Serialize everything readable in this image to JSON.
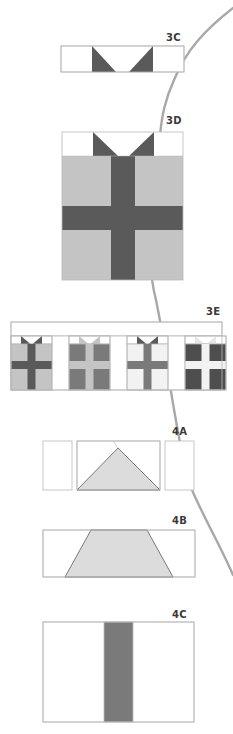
{
  "colors": {
    "outline": "#b8b8b8",
    "dark": "#5a5a5a",
    "medium": "#7a7a7a",
    "light": "#c4c4c4",
    "pale": "#dcdcdc",
    "white": "#ffffff",
    "curve": "#a8a8a8",
    "label": "#3a3a3a"
  },
  "labels": {
    "l3c": "3C",
    "l3d": "3D",
    "l3e": "3E",
    "l4a": "4A",
    "l4b": "4B",
    "l4c": "4C"
  },
  "pieces": [
    {
      "id": "3C",
      "description": "Bow strip: white rectangle with two dark triangles forming a V notch"
    },
    {
      "id": "3D",
      "description": "Single gift block: bow row above light square with dark vertical and horizontal ribbon"
    },
    {
      "id": "3E",
      "description": "Row of four gift blocks with white sashing strip above and between"
    },
    {
      "id": "4A",
      "description": "Three pieces: narrow rectangle, rectangle with pale triangle, narrow rectangle"
    },
    {
      "id": "4B",
      "description": "Rectangle with pale trapezoid"
    },
    {
      "id": "4C",
      "description": "White rectangle with dark vertical center strip"
    }
  ],
  "gifts_3e": [
    {
      "bow": "#5a5a5a",
      "body": "#c4c4c4",
      "ribbon_v": "#5a5a5a",
      "ribbon_h": "#5a5a5a"
    },
    {
      "bow": "#c4c4c4",
      "body": "#7a7a7a",
      "ribbon_v": "#c4c4c4",
      "ribbon_h": "#c4c4c4"
    },
    {
      "bow": "#5a5a5a",
      "body": "#f2f2f2",
      "ribbon_v": "#7a7a7a",
      "ribbon_h": "#7a7a7a"
    },
    {
      "bow": "#e6e6e6",
      "body": "#4e4e4e",
      "ribbon_v": "#f2f2f2",
      "ribbon_h": "#f2f2f2"
    }
  ]
}
